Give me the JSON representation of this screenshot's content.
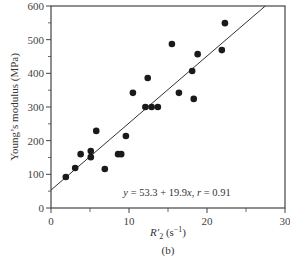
{
  "chart_data": {
    "type": "scatter",
    "title": "",
    "subtitle": "(b)",
    "xlabel": "R'₂ (s⁻¹)",
    "xlabel_main": "R",
    "xlabel_prime": "′",
    "xlabel_sub": "2",
    "xlabel_unit": " (s",
    "xlabel_unit_sup": "−1",
    "xlabel_unit_close": ")",
    "ylabel": "Young’s modulus (MPa)",
    "xlim": [
      0,
      30
    ],
    "ylim": [
      0,
      600
    ],
    "xticks": [
      0,
      10,
      20,
      30
    ],
    "xtick_labels": [
      "0",
      "10",
      "20",
      "30"
    ],
    "x_minor_ticks": [
      5,
      15,
      25
    ],
    "yticks": [
      0,
      100,
      200,
      300,
      400,
      500,
      600
    ],
    "ytick_labels": [
      "0",
      "100",
      "200",
      "300",
      "400",
      "500",
      "600"
    ],
    "y_minor_ticks": [
      50,
      150,
      250,
      350,
      450,
      550
    ],
    "grid": false,
    "legend": null,
    "annotation": "y = 53.3 + 19.9x, r = 0.91",
    "fit_line": {
      "intercept": 53.3,
      "slope": 19.9,
      "r": 0.91
    },
    "points": [
      {
        "x": 1.9,
        "y": 92
      },
      {
        "x": 3.1,
        "y": 119
      },
      {
        "x": 3.8,
        "y": 160
      },
      {
        "x": 5.1,
        "y": 169
      },
      {
        "x": 5.1,
        "y": 151
      },
      {
        "x": 5.8,
        "y": 229
      },
      {
        "x": 6.9,
        "y": 116
      },
      {
        "x": 8.6,
        "y": 160
      },
      {
        "x": 9.0,
        "y": 160
      },
      {
        "x": 9.6,
        "y": 214
      },
      {
        "x": 10.5,
        "y": 342
      },
      {
        "x": 12.1,
        "y": 300
      },
      {
        "x": 12.9,
        "y": 300
      },
      {
        "x": 13.7,
        "y": 300
      },
      {
        "x": 12.4,
        "y": 386
      },
      {
        "x": 16.4,
        "y": 342
      },
      {
        "x": 18.3,
        "y": 324
      },
      {
        "x": 18.1,
        "y": 407
      },
      {
        "x": 15.5,
        "y": 487
      },
      {
        "x": 18.8,
        "y": 457
      },
      {
        "x": 21.9,
        "y": 469
      },
      {
        "x": 22.3,
        "y": 549
      }
    ]
  },
  "colors": {
    "axis": "#444444",
    "point": "#1a1a1a",
    "line": "#333333",
    "text": "#333333"
  }
}
